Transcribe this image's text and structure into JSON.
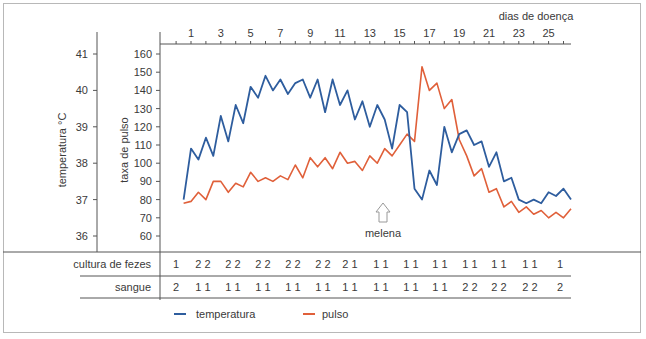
{
  "chart_data": {
    "type": "line",
    "title": "",
    "top_axis_label": "dias de doença",
    "x_ticks": [
      "1",
      "3",
      "5",
      "7",
      "9",
      "11",
      "13",
      "15",
      "17",
      "19",
      "21",
      "23",
      "25"
    ],
    "y_left_label": "temperatura °C",
    "y_left_ticks": [
      "41",
      "40",
      "39",
      "38",
      "37",
      "36"
    ],
    "y_left_range": [
      36,
      41
    ],
    "y_right_label": "taxa de pulso",
    "y_right_ticks": [
      "160",
      "150",
      "140",
      "130",
      "120",
      "110",
      "100",
      "90",
      "80",
      "70",
      "60"
    ],
    "y_right_range": [
      60,
      160
    ],
    "grid": false,
    "legend_position": "bottom",
    "annotation": {
      "text": "melena",
      "day": 13.8
    },
    "x_half_days": [
      0.5,
      1,
      1.5,
      2,
      2.5,
      3,
      3.5,
      4,
      4.5,
      5,
      5.5,
      6,
      6.5,
      7,
      7.5,
      8,
      8.5,
      9,
      9.5,
      10,
      10.5,
      11,
      11.5,
      12,
      12.5,
      13,
      13.5,
      14,
      14.5,
      15,
      15.5,
      16,
      16.5,
      17,
      17.5,
      18,
      18.5,
      19,
      19.5,
      20,
      20.5,
      21,
      21.5,
      22,
      22.5,
      23,
      23.5,
      24,
      24.5,
      25,
      25.5,
      26,
      26.5
    ],
    "series": [
      {
        "name": "temperatura",
        "color": "#2e5d9e",
        "unit": "°C",
        "values": [
          37.0,
          38.4,
          38.1,
          38.7,
          38.2,
          39.3,
          38.6,
          39.6,
          39.1,
          40.1,
          39.8,
          40.4,
          40.0,
          40.3,
          39.9,
          40.2,
          40.3,
          39.8,
          40.3,
          39.4,
          40.3,
          39.6,
          40.0,
          39.2,
          39.7,
          39.0,
          39.6,
          39.2,
          38.4,
          39.6,
          39.4,
          37.3,
          37.0,
          37.8,
          37.4,
          39.0,
          38.3,
          38.8,
          38.9,
          38.5,
          38.6,
          37.9,
          38.3,
          37.5,
          37.6,
          37.0,
          36.9,
          37.0,
          36.9,
          37.2,
          37.1,
          37.3,
          37.0
        ]
      },
      {
        "name": "pulso",
        "color": "#e0603a",
        "unit": "bpm",
        "values": [
          78,
          79,
          84,
          80,
          90,
          90,
          84,
          89,
          87,
          95,
          90,
          92,
          90,
          93,
          91,
          99,
          92,
          103,
          98,
          103,
          97,
          106,
          100,
          101,
          96,
          104,
          100,
          108,
          104,
          110,
          116,
          112,
          153,
          140,
          144,
          130,
          135,
          113,
          104,
          93,
          97,
          84,
          86,
          76,
          79,
          73,
          76,
          72,
          74,
          70,
          73,
          70,
          75
        ]
      }
    ],
    "table": {
      "rows": [
        {
          "label": "cultura de fezes",
          "values": [
            "1",
            "2 2",
            "2 2",
            "2 2",
            "2 2",
            "2 2",
            "2 1",
            "1 1",
            "1 1",
            "1 1",
            "1 1",
            "1 1",
            "1 1",
            "1"
          ]
        },
        {
          "label": "sangue",
          "values": [
            "2",
            "1 1",
            "1 1",
            "1 1",
            "1 1",
            "1 1",
            "1 1",
            "1 1",
            "1 1",
            "1 1",
            "2 2",
            "2 2",
            "2 2",
            "2"
          ]
        }
      ]
    }
  },
  "legend": {
    "temperature": "temperatura",
    "pulse": "pulso"
  },
  "colors": {
    "temperature": "#2e5d9e",
    "pulse": "#e0603a",
    "axis": "#555555"
  }
}
